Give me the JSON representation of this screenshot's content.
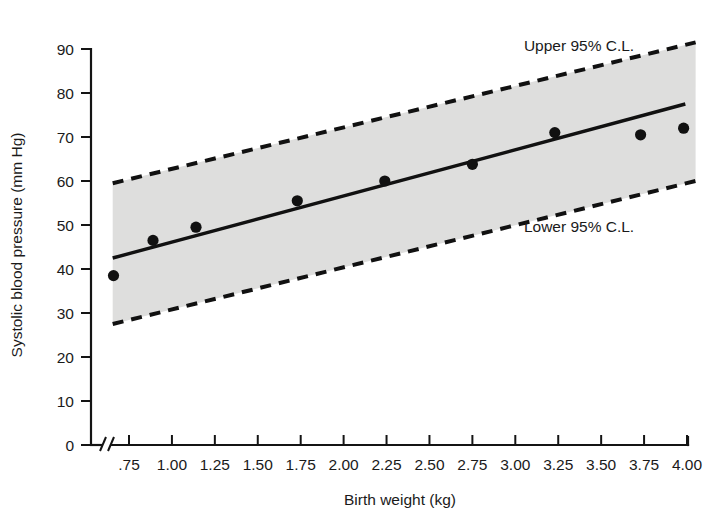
{
  "chart_data": {
    "type": "scatter",
    "title": "",
    "subtitle": "",
    "xlabel": "Birth weight (kg)",
    "ylabel": "Systolic blood pressure (mm Hg)",
    "xlim": [
      0.625,
      4.06
    ],
    "ylim": [
      0,
      90
    ],
    "grid": false,
    "legend_position": "none",
    "x_ticks": [
      0.75,
      1.0,
      1.25,
      1.5,
      1.75,
      2.0,
      2.25,
      2.5,
      2.75,
      3.0,
      3.25,
      3.5,
      3.75,
      4.0
    ],
    "x_tick_labels": [
      ".75",
      "1.00",
      "1.25",
      "1.50",
      "1.75",
      "2.00",
      "2.25",
      "2.50",
      "2.75",
      "3.00",
      "3.25",
      "3.50",
      "3.75",
      "4.00"
    ],
    "y_ticks": [
      0,
      10,
      20,
      30,
      40,
      50,
      60,
      70,
      80,
      90
    ],
    "y_tick_labels": [
      "0",
      "10",
      "20",
      "30",
      "40",
      "50",
      "60",
      "70",
      "80",
      "90"
    ],
    "axis_break": true,
    "axis_break_label": "//",
    "points": [
      {
        "x": 0.66,
        "y": 38.5
      },
      {
        "x": 0.89,
        "y": 46.5
      },
      {
        "x": 1.14,
        "y": 49.5
      },
      {
        "x": 1.73,
        "y": 55.5
      },
      {
        "x": 2.24,
        "y": 60.0
      },
      {
        "x": 2.75,
        "y": 63.8
      },
      {
        "x": 3.23,
        "y": 71.0
      },
      {
        "x": 3.73,
        "y": 70.5
      },
      {
        "x": 3.98,
        "y": 72.0
      }
    ],
    "series": [
      {
        "name": "Regression line",
        "type": "line",
        "style": "solid",
        "x": [
          0.655,
          3.99
        ],
        "values": [
          42.5,
          77.5
        ]
      },
      {
        "name": "Upper 95% C.L.",
        "type": "line",
        "style": "dashed",
        "x": [
          0.655,
          4.05
        ],
        "values": [
          59.5,
          91.5
        ]
      },
      {
        "name": "Lower 95% C.L.",
        "type": "line",
        "style": "dashed",
        "x": [
          0.655,
          4.05
        ],
        "values": [
          27.5,
          60.0
        ]
      }
    ],
    "annotations": [
      {
        "text": "Upper 95% C.L.",
        "x": 3.05,
        "y": 89.5
      },
      {
        "text": "Lower 95% C.L.",
        "x": 3.05,
        "y": 48.5
      }
    ],
    "band": {
      "name": "95% confidence band",
      "fill_color": "#dededd"
    },
    "colors": {
      "point": "#111111",
      "line": "#111111",
      "band": "#dededd",
      "axis": "#141414",
      "text": "#1a1a1a",
      "background": "#ffffff"
    }
  }
}
